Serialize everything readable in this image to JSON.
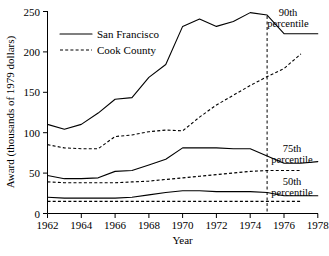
{
  "chart_data": {
    "type": "line",
    "title": "",
    "xlabel": "Year",
    "ylabel": "Award (thousands of 1979 dollars)",
    "xlim": [
      1962,
      1978
    ],
    "ylim": [
      0,
      250
    ],
    "xticks": [
      1962,
      1964,
      1966,
      1968,
      1970,
      1972,
      1974,
      1976,
      1978
    ],
    "yticks": [
      0,
      50,
      100,
      150,
      200,
      250
    ],
    "grid": false,
    "legend_position": "upper-left",
    "legend": [
      {
        "name": "San Francisco",
        "style": "solid"
      },
      {
        "name": "Cook County",
        "style": "dashed"
      }
    ],
    "annotations": [
      {
        "text_line1": "90th",
        "text_line2": "percentile"
      },
      {
        "text_line1": "75th",
        "text_line2": "percentile"
      },
      {
        "text_line1": "50th",
        "text_line2": "percentile"
      }
    ],
    "reference_line": {
      "x": 1975,
      "style": "dashed"
    },
    "series": [
      {
        "name": "San Francisco",
        "percentile": "90th",
        "style": "solid",
        "x": [
          1962,
          1963,
          1964,
          1965,
          1966,
          1967,
          1968,
          1969,
          1970,
          1971,
          1972,
          1973,
          1974,
          1975,
          1976,
          1977,
          1978
        ],
        "values": [
          110,
          104,
          110,
          124,
          141,
          143,
          168,
          184,
          231,
          240,
          231,
          237,
          248,
          245,
          222,
          222,
          222
        ]
      },
      {
        "name": "Cook County",
        "percentile": "90th",
        "style": "dashed",
        "x": [
          1962,
          1963,
          1964,
          1965,
          1966,
          1967,
          1968,
          1969,
          1970,
          1971,
          1972,
          1973,
          1974,
          1975,
          1976,
          1977
        ],
        "values": [
          85,
          81,
          80,
          80,
          95,
          97,
          101,
          103,
          102,
          119,
          134,
          146,
          158,
          169,
          179,
          197
        ]
      },
      {
        "name": "San Francisco",
        "percentile": "75th",
        "style": "solid",
        "x": [
          1962,
          1963,
          1964,
          1965,
          1966,
          1967,
          1968,
          1969,
          1970,
          1971,
          1972,
          1973,
          1974,
          1975,
          1976,
          1977,
          1978
        ],
        "values": [
          47,
          43,
          43,
          44,
          52,
          53,
          60,
          67,
          81,
          81,
          81,
          80,
          80,
          71,
          62,
          62,
          64
        ]
      },
      {
        "name": "Cook County",
        "percentile": "75th",
        "style": "dashed",
        "x": [
          1962,
          1963,
          1964,
          1965,
          1966,
          1967,
          1968,
          1969,
          1970,
          1971,
          1972,
          1973,
          1974,
          1975,
          1976,
          1977
        ],
        "values": [
          39,
          38,
          38,
          38,
          38,
          39,
          40,
          42,
          44,
          46,
          48,
          50,
          52,
          53,
          53,
          53
        ]
      },
      {
        "name": "San Francisco",
        "percentile": "50th",
        "style": "solid",
        "x": [
          1962,
          1963,
          1964,
          1965,
          1966,
          1967,
          1968,
          1969,
          1970,
          1971,
          1972,
          1973,
          1974,
          1975,
          1976,
          1977,
          1978
        ],
        "values": [
          20,
          19,
          19,
          19,
          19,
          20,
          23,
          26,
          28,
          28,
          27,
          27,
          27,
          26,
          22,
          22,
          22
        ]
      },
      {
        "name": "Cook County",
        "percentile": "50th",
        "style": "dashed",
        "x": [
          1962,
          1963,
          1964,
          1965,
          1966,
          1967,
          1968,
          1969,
          1970,
          1971,
          1972,
          1973,
          1974,
          1975,
          1976,
          1977
        ],
        "values": [
          15,
          15,
          15,
          15,
          15,
          15,
          15,
          15,
          15,
          15,
          15,
          15,
          15,
          15,
          15,
          15
        ]
      }
    ]
  },
  "axis": {
    "xlabel": "Year",
    "ylabel": "Award (thousands of 1979 dollars)",
    "xticks": [
      "1962",
      "1964",
      "1966",
      "1968",
      "1970",
      "1972",
      "1974",
      "1976",
      "1978"
    ],
    "yticks": [
      "250",
      "200",
      "150",
      "100",
      "50",
      "0"
    ]
  },
  "legend": {
    "entry1": "San Francisco",
    "entry2": "Cook County"
  },
  "annotations": {
    "p90_line1": "90th",
    "p90_line2": "percentile",
    "p75_line1": "75th",
    "p75_line2": "percentile",
    "p50_line1": "50th",
    "p50_line2": "percentile"
  },
  "colors": {
    "line": "#000000",
    "background": "#ffffff"
  }
}
